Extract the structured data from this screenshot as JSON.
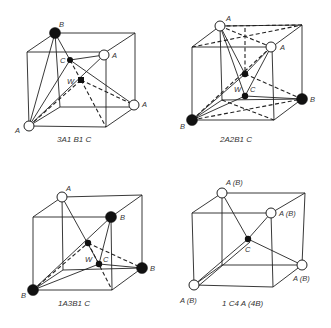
{
  "panels": [
    {
      "id": "panel-1",
      "caption": "3A1 B1 C",
      "labels": {
        "b_top": "B",
        "c": "C",
        "w": "W",
        "a_top_right": "A",
        "a_right": "A",
        "a_bottom_left": "A"
      }
    },
    {
      "id": "panel-2",
      "caption": "2A2B1 C",
      "labels": {
        "a_top": "A",
        "a_right": "A",
        "w": "W",
        "c": "C",
        "b_right": "B",
        "b_bottom_left": "B"
      }
    },
    {
      "id": "panel-3",
      "caption": "1A3B1 C",
      "labels": {
        "a_top": "A",
        "b_top_right": "B",
        "w": "W",
        "c": "C",
        "b_right": "B",
        "b_bottom_left": "B"
      }
    },
    {
      "id": "panel-4",
      "caption": "1 C4 A (4B)",
      "labels": {
        "ab_top": "A (B)",
        "ab_top_right": "A (B)",
        "c": "C",
        "ab_right": "A (B)",
        "ab_bottom_left": "A (B)"
      }
    }
  ],
  "legend": {
    "open_circle": "A atom",
    "filled_large_circle": "B atom",
    "filled_small_dot": "C / W site"
  }
}
